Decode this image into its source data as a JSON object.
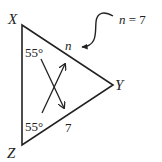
{
  "diagram": {
    "type": "triangle",
    "vertices": {
      "X": {
        "label": "X"
      },
      "Y": {
        "label": "Y"
      },
      "Z": {
        "label": "Z"
      }
    },
    "angles": {
      "X": "55°",
      "Z": "55°"
    },
    "sides": {
      "XY": "n",
      "ZY": "7"
    },
    "annotation": {
      "text_var": "n",
      "text_rest": " = 7"
    },
    "colors": {
      "stroke": "#222222",
      "background": "#ffffff"
    }
  }
}
